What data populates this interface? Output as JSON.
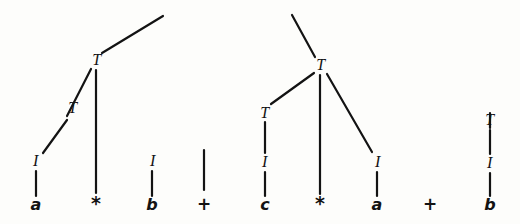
{
  "figure": {
    "kind": "parse-tree-diagram",
    "background_color": "#fdfdfb",
    "ink_color": "#131313",
    "stroke_width": 2.2
  },
  "chart_data": {
    "type": "diagram",
    "title": "",
    "nodes": [
      {
        "id": "n1",
        "label": "T",
        "kind": "nonterminal",
        "x": 97,
        "y": 60
      },
      {
        "id": "n2",
        "label": "T",
        "kind": "nonterminal",
        "x": 73,
        "y": 108
      },
      {
        "id": "n3",
        "label": "I",
        "kind": "nonterminal",
        "x": 36,
        "y": 161
      },
      {
        "id": "n4",
        "label": "a",
        "kind": "terminal",
        "x": 36,
        "y": 205
      },
      {
        "id": "n5",
        "label": "*",
        "kind": "terminal",
        "x": 96,
        "y": 203
      },
      {
        "id": "n6",
        "label": "I",
        "kind": "nonterminal",
        "x": 153,
        "y": 161
      },
      {
        "id": "n7",
        "label": "b",
        "kind": "terminal",
        "x": 152,
        "y": 205
      },
      {
        "id": "n8",
        "label": "+",
        "kind": "terminal",
        "x": 204,
        "y": 204
      },
      {
        "id": "n9",
        "label": "T",
        "kind": "nonterminal",
        "x": 321,
        "y": 65
      },
      {
        "id": "n10",
        "label": "T",
        "kind": "nonterminal",
        "x": 265,
        "y": 113
      },
      {
        "id": "n11",
        "label": "I",
        "kind": "nonterminal",
        "x": 265,
        "y": 162
      },
      {
        "id": "n12",
        "label": "c",
        "kind": "terminal",
        "x": 265,
        "y": 205
      },
      {
        "id": "n13",
        "label": "*",
        "kind": "terminal",
        "x": 320,
        "y": 203
      },
      {
        "id": "n14",
        "label": "I",
        "kind": "nonterminal",
        "x": 378,
        "y": 162
      },
      {
        "id": "n15",
        "label": "a",
        "kind": "terminal",
        "x": 377,
        "y": 205
      },
      {
        "id": "n16",
        "label": "+",
        "kind": "terminal",
        "x": 430,
        "y": 204
      },
      {
        "id": "n17",
        "label": "T",
        "kind": "nonterminal",
        "x": 490,
        "y": 120
      },
      {
        "id": "n18",
        "label": "I",
        "kind": "nonterminal",
        "x": 490,
        "y": 163
      },
      {
        "id": "n19",
        "label": "b",
        "kind": "terminal",
        "x": 490,
        "y": 205
      }
    ],
    "edges": [
      {
        "name": "tree1-root-up",
        "x1": 102,
        "y1": 53,
        "x2": 163,
        "y2": 16
      },
      {
        "name": "tree1-T-to-T",
        "x1": 91,
        "y1": 69,
        "x2": 67,
        "y2": 116
      },
      {
        "name": "tree1-T-to-I",
        "x1": 67,
        "y1": 120,
        "x2": 43,
        "y2": 153
      },
      {
        "name": "tree1-I-to-a",
        "x1": 36,
        "y1": 171,
        "x2": 36,
        "y2": 196
      },
      {
        "name": "tree1-T-to-star",
        "x1": 96,
        "y1": 70,
        "x2": 96,
        "y2": 193
      },
      {
        "name": "tree1-I-to-b",
        "x1": 152,
        "y1": 171,
        "x2": 152,
        "y2": 196
      },
      {
        "name": "plus1-stem",
        "x1": 204,
        "y1": 150,
        "x2": 204,
        "y2": 190
      },
      {
        "name": "tree2-root-up",
        "x1": 315,
        "y1": 57,
        "x2": 292,
        "y2": 15
      },
      {
        "name": "tree2-T-to-T",
        "x1": 314,
        "y1": 73,
        "x2": 271,
        "y2": 104
      },
      {
        "name": "tree2-T-to-I",
        "x1": 265,
        "y1": 122,
        "x2": 265,
        "y2": 153
      },
      {
        "name": "tree2-I-to-c",
        "x1": 265,
        "y1": 172,
        "x2": 265,
        "y2": 196
      },
      {
        "name": "tree2-T-to-star",
        "x1": 320,
        "y1": 75,
        "x2": 320,
        "y2": 194
      },
      {
        "name": "tree2-T-to-Iright",
        "x1": 327,
        "y1": 74,
        "x2": 372,
        "y2": 152
      },
      {
        "name": "tree2-I-to-a",
        "x1": 377,
        "y1": 172,
        "x2": 377,
        "y2": 196
      },
      {
        "name": "plus2-none",
        "x1": 0,
        "y1": 0,
        "x2": 0,
        "y2": 0
      },
      {
        "name": "tree3-stem-up",
        "x1": 490,
        "y1": 113,
        "x2": 490,
        "y2": 128
      },
      {
        "name": "tree3-T-to-I",
        "x1": 490,
        "y1": 130,
        "x2": 490,
        "y2": 154
      },
      {
        "name": "tree3-I-to-b",
        "x1": 490,
        "y1": 173,
        "x2": 490,
        "y2": 196
      }
    ],
    "terminal_string": "a * b + c * a + b",
    "nonterminal_symbols": [
      "T",
      "I"
    ],
    "xlabel": "",
    "ylabel": "",
    "legend": []
  }
}
